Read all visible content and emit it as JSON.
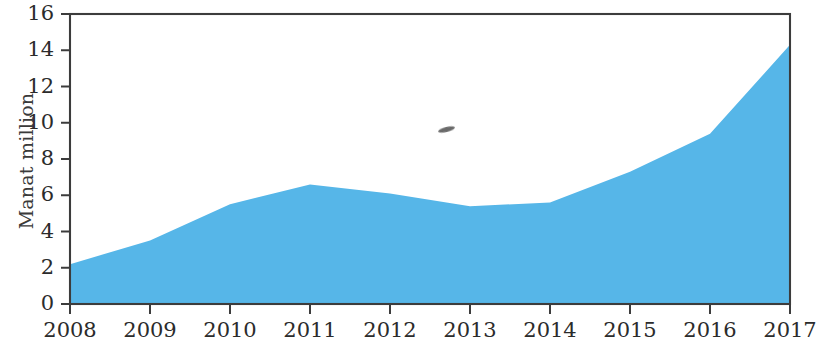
{
  "chart_data": {
    "type": "area",
    "title": "",
    "subtitle": "",
    "xlabel": "",
    "ylabel": "Manat million",
    "categories": [
      "2008",
      "2009",
      "2010",
      "2011",
      "2012",
      "2013",
      "2014",
      "2015",
      "2016",
      "2017"
    ],
    "values": [
      2.2,
      3.5,
      5.5,
      6.6,
      6.1,
      5.4,
      5.6,
      7.3,
      9.4,
      14.3
    ],
    "series": [
      {
        "name": "Manat million",
        "values": [
          2.2,
          3.5,
          5.5,
          6.6,
          6.1,
          5.4,
          5.6,
          7.3,
          9.4,
          14.3
        ]
      }
    ],
    "ylim": [
      0,
      16
    ],
    "ytick_values": [
      0,
      2,
      4,
      6,
      8,
      10,
      12,
      14,
      16
    ],
    "ytick_labels": [
      "0",
      "2",
      "4",
      "6",
      "8",
      "10",
      "12",
      "14",
      "16"
    ],
    "xtick_labels": [
      "2008",
      "2009",
      "2010",
      "2011",
      "2012",
      "2013",
      "2014",
      "2015",
      "2016",
      "2017"
    ],
    "grid": false,
    "legend": false,
    "legend_position": "none",
    "area_color": "#56b6e8",
    "axis_color": "#3c3c3c",
    "text_color": "#2b2b2b",
    "annotations": []
  }
}
